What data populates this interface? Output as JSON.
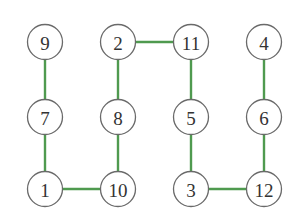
{
  "diagram": {
    "type": "graph",
    "node_radius": 17.5,
    "colors": {
      "edge": "#4f9a4f",
      "node_stroke": "#6a6a6a",
      "node_fill": "#ffffff",
      "label": "#333333"
    },
    "nodes": [
      {
        "id": "9",
        "label": "9",
        "x": 45,
        "y": 42
      },
      {
        "id": "2",
        "label": "2",
        "x": 118,
        "y": 42
      },
      {
        "id": "11",
        "label": "11",
        "x": 191,
        "y": 42
      },
      {
        "id": "4",
        "label": "4",
        "x": 264,
        "y": 42
      },
      {
        "id": "7",
        "label": "7",
        "x": 45,
        "y": 117
      },
      {
        "id": "8",
        "label": "8",
        "x": 118,
        "y": 117
      },
      {
        "id": "5",
        "label": "5",
        "x": 191,
        "y": 117
      },
      {
        "id": "6",
        "label": "6",
        "x": 264,
        "y": 117
      },
      {
        "id": "1",
        "label": "1",
        "x": 45,
        "y": 189
      },
      {
        "id": "10",
        "label": "10",
        "x": 118,
        "y": 189
      },
      {
        "id": "3",
        "label": "3",
        "x": 191,
        "y": 189
      },
      {
        "id": "12",
        "label": "12",
        "x": 264,
        "y": 189
      }
    ],
    "edges": [
      {
        "from": "9",
        "to": "7"
      },
      {
        "from": "7",
        "to": "1"
      },
      {
        "from": "1",
        "to": "10"
      },
      {
        "from": "10",
        "to": "8"
      },
      {
        "from": "8",
        "to": "2"
      },
      {
        "from": "2",
        "to": "11"
      },
      {
        "from": "11",
        "to": "5"
      },
      {
        "from": "5",
        "to": "3"
      },
      {
        "from": "3",
        "to": "12"
      },
      {
        "from": "12",
        "to": "6"
      },
      {
        "from": "6",
        "to": "4"
      }
    ]
  }
}
